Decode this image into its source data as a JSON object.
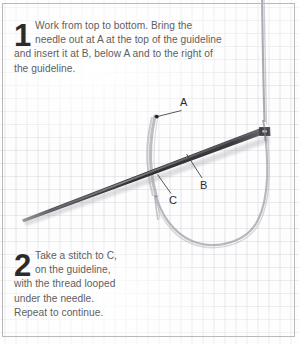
{
  "diagram": {
    "medium": "fabric-weave-background",
    "steps": [
      {
        "number": "1",
        "lines": [
          "Work from top to bottom. Bring the",
          "needle out at A at the top of the guideline",
          "and insert it at B, below A and to the right of",
          "the guideline."
        ]
      },
      {
        "number": "2",
        "lines": [
          "Take a stitch to C,",
          "on the guideline,",
          "with the thread looped",
          "under the needle.",
          "Repeat to continue."
        ]
      }
    ],
    "point_labels": [
      {
        "id": "A",
        "text": "A"
      },
      {
        "id": "B",
        "text": "B"
      },
      {
        "id": "C",
        "text": "C"
      }
    ],
    "colors": {
      "fabric": "#fdfdfd",
      "weave": "#aeacb6",
      "needle": "#2f2f33",
      "thread": "#8e8c96",
      "text": "#5e5e62",
      "numeral": "#2b2b2e",
      "border": "#b9b9bd"
    }
  }
}
